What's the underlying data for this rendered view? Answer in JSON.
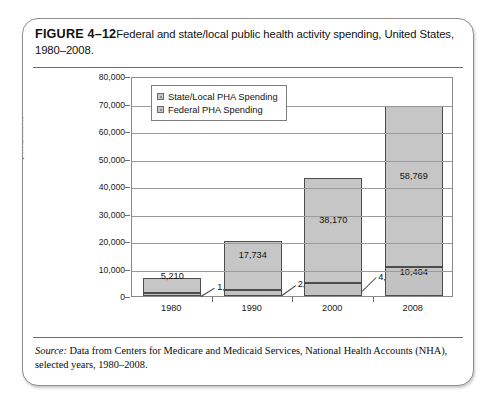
{
  "figure": {
    "number_label": "FIGURE 4–12",
    "caption": "Federal and state/local public health activity spending, United States, 1980–2008.",
    "source_label": "Source:",
    "source_text": " Data from Centers for Medicare and Medicaid Services, National Health Accounts (NHA), selected years, 1980–2008."
  },
  "chart_data": {
    "type": "bar",
    "subtype": "stacked",
    "title": "Federal and state/local public health activity spending, United States, 1980–2008",
    "xlabel": "",
    "ylabel": "$ in Billions",
    "categories": [
      "1980",
      "1990",
      "2000",
      "2008"
    ],
    "ylim": [
      0,
      80000
    ],
    "ytick_step": 10000,
    "yticks": [
      "80,000",
      "70,000",
      "60,000",
      "50,000",
      "40,000",
      "30,000",
      "20,000",
      "10,000",
      "0"
    ],
    "ytick_values": [
      80000,
      70000,
      60000,
      50000,
      40000,
      30000,
      20000,
      10000,
      0
    ],
    "grid": true,
    "legend_position": "top-left-inside",
    "series": [
      {
        "name": "State/Local PHA Spending",
        "values": [
          5210,
          17734,
          38170,
          58769
        ],
        "labels": [
          "5,210",
          "17,734",
          "38,170",
          "58,769"
        ],
        "color": "#c6c6c6",
        "stack_order": "top"
      },
      {
        "name": "Federal PHA Spending",
        "values": [
          1216,
          2262,
          4879,
          10464
        ],
        "labels": [
          "1,216",
          "2,262",
          "4,879",
          "10,464"
        ],
        "color": "#c2c2c2",
        "stack_order": "bottom"
      }
    ],
    "totals": [
      6426,
      19996,
      43049,
      69233
    ]
  }
}
